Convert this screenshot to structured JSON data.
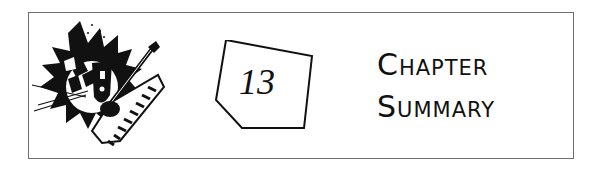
{
  "banner": {
    "chapter_number": "13",
    "title_line1": "Chapter",
    "title_line2": "Summary",
    "icon": "music-clipart-icon",
    "colors": {
      "ink": "#111111",
      "border": "#6e6e6e",
      "background": "#ffffff"
    }
  }
}
